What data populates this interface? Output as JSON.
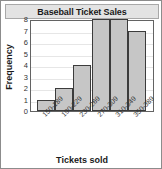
{
  "chart_data": {
    "type": "bar",
    "title": "Baseball Ticket Sales",
    "xlabel": "Tickets sold",
    "ylabel": "Frequency",
    "categories": [
      "150-189",
      "190-229",
      "230-269",
      "270-309",
      "310-349",
      "350-389"
    ],
    "values": [
      1,
      2,
      4,
      8,
      8,
      7
    ],
    "ylim": [
      0,
      8
    ],
    "yticks": [
      0,
      1,
      2,
      3,
      4,
      5,
      6,
      7,
      8
    ],
    "ytick_labels": [
      "0",
      "1",
      "2",
      "3",
      "4",
      "5",
      "6",
      "7",
      "8"
    ],
    "grid": true,
    "legend": "none",
    "bar_fill_color": "#c6c6c6",
    "bar_edge_color": "#3c3c3c",
    "plot_border_color": "#636363",
    "title_banner_color": "#e3e3e3",
    "gridline_color": "#e6e6e6"
  }
}
